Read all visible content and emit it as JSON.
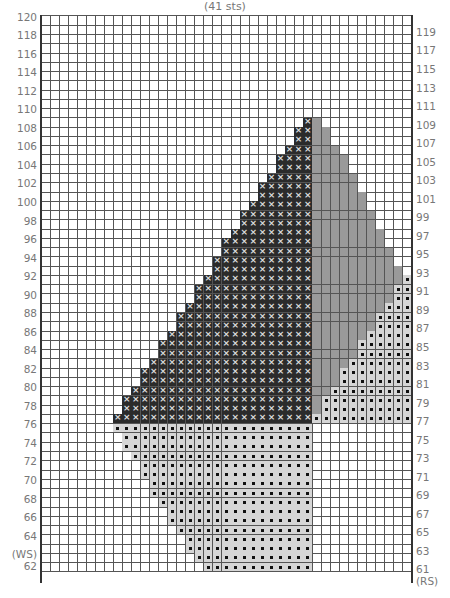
{
  "chart_data": {
    "type": "table",
    "title": "(41 sts)",
    "columns": 41,
    "rows": {
      "from": 61,
      "to": 120
    },
    "left_labels": {
      "rows": [
        62,
        64,
        66,
        68,
        70,
        72,
        74,
        76,
        78,
        80,
        82,
        84,
        86,
        88,
        90,
        92,
        94,
        96,
        98,
        100,
        102,
        104,
        106,
        108,
        110,
        112,
        114,
        116,
        118,
        120
      ],
      "special": {
        "62": "(WS) 62"
      }
    },
    "right_labels": {
      "rows": [
        61,
        63,
        65,
        67,
        69,
        71,
        73,
        75,
        77,
        79,
        81,
        83,
        85,
        87,
        89,
        91,
        93,
        95,
        97,
        99,
        101,
        103,
        105,
        107,
        109,
        111,
        113,
        115,
        117,
        119
      ],
      "special": {
        "61": "61 (RS)"
      }
    },
    "legend": {
      "X": "cross stitch (dark)",
      "G": "gray contrast",
      "D": "dot stitch (light)"
    },
    "colors": {
      "X": "#2b2b2b",
      "G": "#9a9a9a",
      "D": "#d6d6d6",
      "grid": "#555555"
    },
    "cells": {
      "X_left_edge_by_row": {
        "77": 8,
        "78": 9,
        "79": 9,
        "80": 10,
        "81": 11,
        "82": 11,
        "83": 12,
        "84": 13,
        "85": 13,
        "86": 14,
        "87": 15,
        "88": 15,
        "89": 16,
        "90": 17,
        "91": 17,
        "92": 18,
        "93": 19,
        "94": 19,
        "95": 20,
        "96": 20,
        "97": 21,
        "98": 22,
        "99": 22,
        "100": 23,
        "101": 24,
        "102": 24,
        "103": 25,
        "104": 26,
        "105": 26,
        "106": 27,
        "107": 28,
        "108": 28,
        "109": 29
      },
      "X_right_edge": 29,
      "G_right_edge_by_row": {
        "92": 39,
        "93": 39,
        "94": 38,
        "95": 38,
        "96": 37,
        "97": 37,
        "98": 36,
        "99": 36,
        "100": 35,
        "101": 35,
        "102": 34,
        "103": 34,
        "104": 33,
        "105": 33,
        "106": 32,
        "107": 31,
        "108": 31,
        "109": 30
      },
      "G_left_edge": 30,
      "D_right_start_by_row": {
        "77": 30,
        "78": 31,
        "79": 31,
        "80": 32,
        "81": 33,
        "82": 33,
        "83": 34,
        "84": 35,
        "85": 35,
        "86": 36,
        "87": 37,
        "88": 37,
        "89": 38,
        "90": 39,
        "91": 39,
        "92": 40
      },
      "D_right_end": 40,
      "D_lower_left_edge_by_row": {
        "61": 18,
        "62": 17,
        "63": 16,
        "64": 16,
        "65": 15,
        "66": 14,
        "67": 14,
        "68": 13,
        "69": 12,
        "70": 12,
        "71": 11,
        "72": 11,
        "73": 10,
        "74": 9,
        "75": 9,
        "76": 8
      },
      "D_lower_right_edge": 29
    },
    "xlabel": "",
    "ylabel": "Row"
  }
}
